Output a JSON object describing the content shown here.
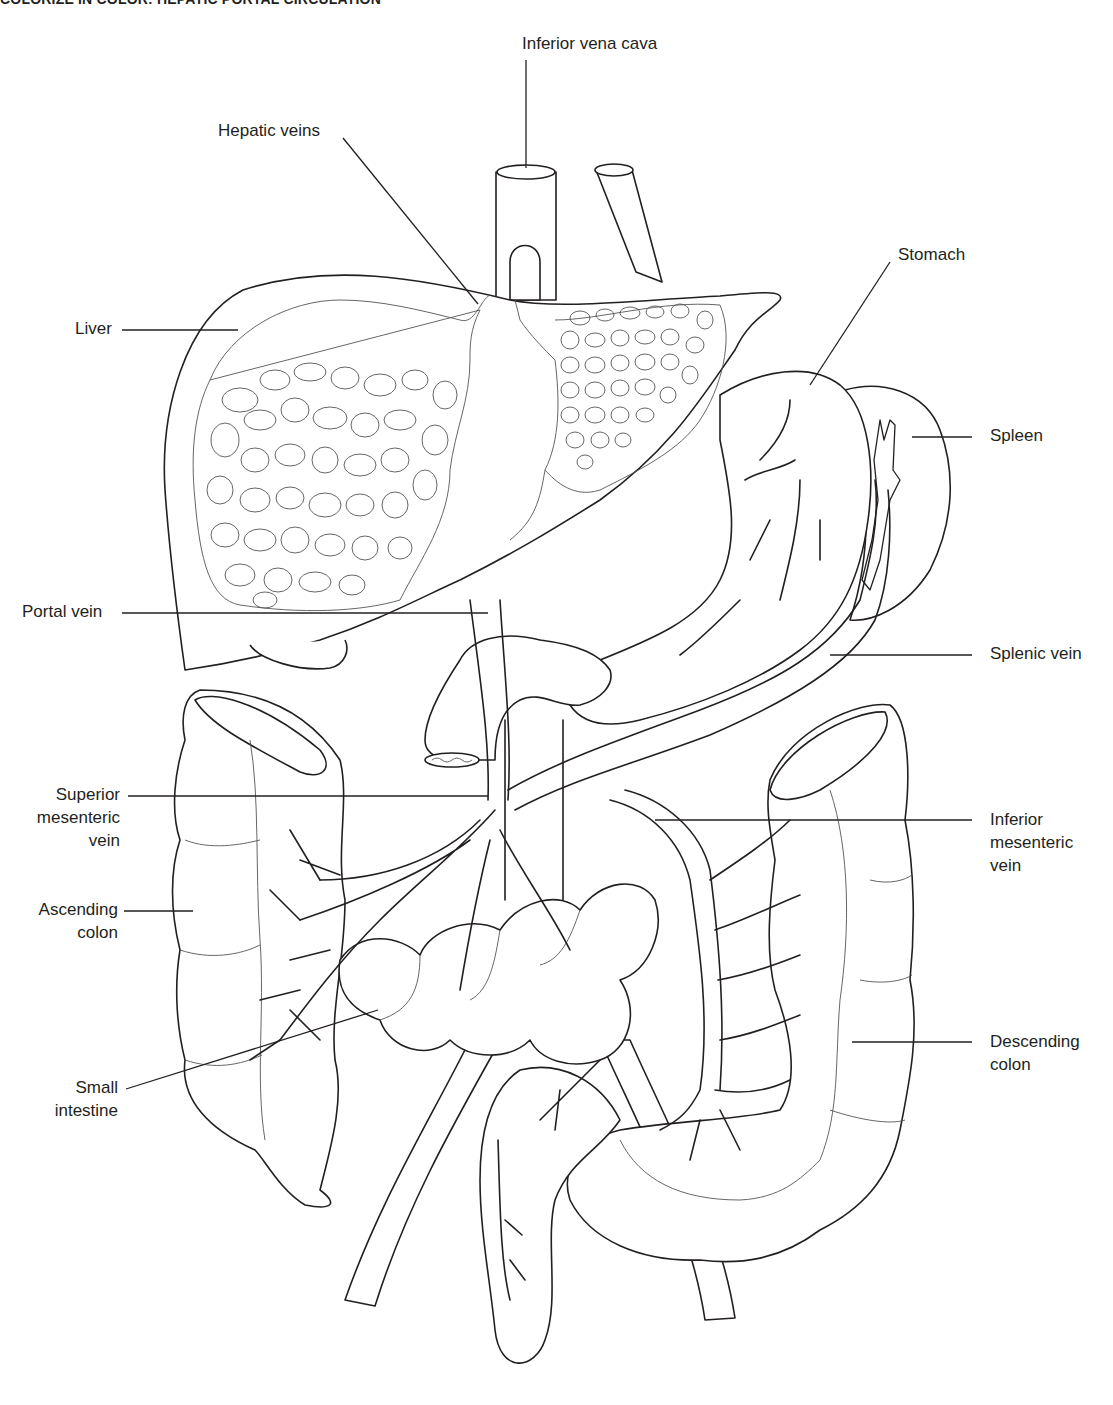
{
  "header": {
    "title": "COLORIZE IN COLOR: HEPATIC PORTAL CIRCULATION"
  },
  "labels": {
    "inferior_vena_cava": "Inferior vena cava",
    "hepatic_veins": "Hepatic veins",
    "stomach": "Stomach",
    "liver": "Liver",
    "spleen": "Spleen",
    "portal_vein": "Portal vein",
    "splenic_vein": "Splenic vein",
    "superior_mesenteric_vein": [
      "Superior",
      "mesenteric",
      "vein"
    ],
    "inferior_mesenteric_vein": [
      "Inferior",
      "mesenteric",
      "vein"
    ],
    "ascending_colon": [
      "Ascending",
      "colon"
    ],
    "small_intestine": [
      "Small",
      "intestine"
    ],
    "descending_colon": [
      "Descending",
      "colon"
    ]
  },
  "colors": {
    "line": "#231f20",
    "background": "#ffffff"
  }
}
